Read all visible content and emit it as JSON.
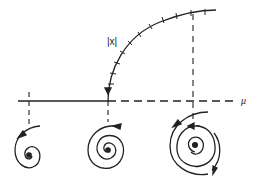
{
  "figure": {
    "type": "hopf-bifurcation-diagram",
    "ylabel": "|x|",
    "xlabel": "μ",
    "colors": {
      "ink": "#222222",
      "background": "#ffffff"
    },
    "phase_portraits": [
      {
        "label": "stable-focus",
        "description": "inward spiral to stable point"
      },
      {
        "label": "critical",
        "description": "weakly attracting spiral at bifurcation"
      },
      {
        "label": "limit-cycle",
        "description": "unstable point, stable limit cycle"
      }
    ]
  }
}
